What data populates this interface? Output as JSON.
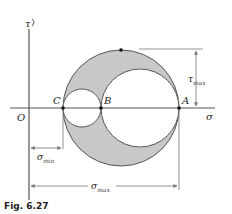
{
  "figure": {
    "caption": "Fig. 6.27",
    "type": "Mohr's circle"
  },
  "axes": {
    "vertical_label": "τ",
    "horizontal_label": "σ",
    "origin_label": "O"
  },
  "points": {
    "C": "C",
    "B": "B",
    "A": "A"
  },
  "dimensions": {
    "tau_max": {
      "symbol": "τ",
      "subscript": "max"
    },
    "sigma_min": {
      "symbol": "σ",
      "subscript": "min"
    },
    "sigma_max": {
      "symbol": "σ",
      "subscript": "max"
    }
  },
  "colors": {
    "shade": "#c8c8c8",
    "line": "#555555",
    "axis": "#444444",
    "dim": "#777777"
  }
}
